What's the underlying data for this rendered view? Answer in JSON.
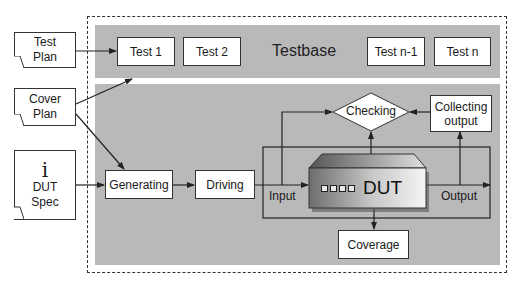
{
  "documents": {
    "test_plan": {
      "line1": "Test",
      "line2": "Plan"
    },
    "cover_plan": {
      "line1": "Cover",
      "line2": "Plan"
    },
    "dut_spec": {
      "icon": "info-icon",
      "icon_glyph": "i",
      "line1": "DUT",
      "line2": "Spec"
    }
  },
  "testbase": {
    "title": "Testbase",
    "tests": [
      "Test 1",
      "Test 2",
      "Test n-1",
      "Test n"
    ]
  },
  "testbench": {
    "generating": "Generating",
    "driving": "Driving",
    "checking": "Checking",
    "collecting_output": {
      "line1": "Collecting",
      "line2": "output"
    },
    "dut": "DUT",
    "input_label": "Input",
    "output_label": "Output",
    "coverage": "Coverage"
  },
  "colors": {
    "gray_band": "#b9b9b9",
    "line": "#222222",
    "box_fill": "#ffffff"
  }
}
